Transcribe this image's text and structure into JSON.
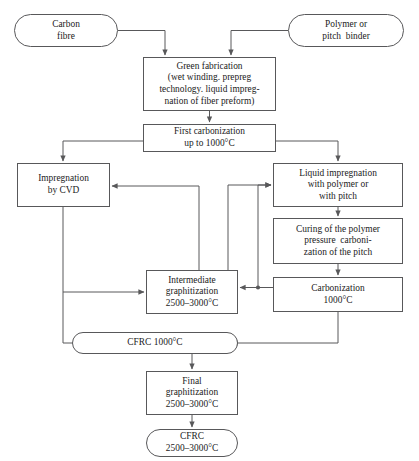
{
  "diagram": {
    "type": "flowchart",
    "stroke_color": "#58585a",
    "text_color": "#1b1b1b",
    "background": "#ffffff",
    "corner_mark": "",
    "nodes": [
      {
        "id": "carbon-fibre",
        "shape": "terminal",
        "lines": [
          "Carbon",
          "fibre"
        ]
      },
      {
        "id": "polymer-binder",
        "shape": "terminal",
        "lines": [
          "Polymer or",
          "pitch  binder"
        ]
      },
      {
        "id": "green-fabrication",
        "shape": "process",
        "lines": [
          "Green fabrication",
          "(wet winding. prepreg",
          "technology. liquid impreg-",
          "nation of fiber preform)"
        ]
      },
      {
        "id": "first-carbonization",
        "shape": "process",
        "lines": [
          "First carbonization",
          "up to 1000°C"
        ]
      },
      {
        "id": "impregnation-cvd",
        "shape": "process",
        "lines": [
          "Impregnation",
          "by CVD"
        ]
      },
      {
        "id": "liquid-impregnation",
        "shape": "process",
        "lines": [
          "Liquid impregnation",
          "with polymer or",
          "with pitch"
        ]
      },
      {
        "id": "curing-polymer",
        "shape": "process",
        "lines": [
          "Curing of the polymer",
          "pressure  carboni-",
          "zation of the pitch"
        ]
      },
      {
        "id": "carbonization",
        "shape": "process",
        "lines": [
          "Carbonization",
          "1000°C"
        ]
      },
      {
        "id": "intermediate-graphitization",
        "shape": "process",
        "lines": [
          "Intermediate",
          "graphitization",
          "2500–3000°C"
        ]
      },
      {
        "id": "cfrc-1000",
        "shape": "terminal",
        "lines": [
          "CFRC 1000°C"
        ]
      },
      {
        "id": "final-graphitization",
        "shape": "process",
        "lines": [
          "Final",
          "graphitization",
          "2500–3000°C"
        ]
      },
      {
        "id": "cfrc-final",
        "shape": "terminal",
        "lines": [
          "CFRC",
          "2500–3000°C"
        ]
      }
    ],
    "edges": [
      {
        "from": "carbon-fibre",
        "to": "green-fabrication"
      },
      {
        "from": "polymer-binder",
        "to": "green-fabrication"
      },
      {
        "from": "green-fabrication",
        "to": "first-carbonization"
      },
      {
        "from": "first-carbonization",
        "to": "impregnation-cvd"
      },
      {
        "from": "first-carbonization",
        "to": "liquid-impregnation"
      },
      {
        "from": "impregnation-cvd",
        "to": "intermediate-graphitization"
      },
      {
        "from": "impregnation-cvd",
        "to": "cfrc-1000"
      },
      {
        "from": "liquid-impregnation",
        "to": "curing-polymer"
      },
      {
        "from": "curing-polymer",
        "to": "carbonization"
      },
      {
        "from": "carbonization",
        "to": "intermediate-graphitization"
      },
      {
        "from": "carbonization",
        "to": "cfrc-1000"
      },
      {
        "from": "carbonization",
        "to": "liquid-impregnation"
      },
      {
        "from": "intermediate-graphitization",
        "to": "liquid-impregnation"
      },
      {
        "from": "intermediate-graphitization",
        "to": "impregnation-cvd"
      },
      {
        "from": "cfrc-1000",
        "to": "final-graphitization"
      },
      {
        "from": "final-graphitization",
        "to": "cfrc-final"
      }
    ]
  }
}
